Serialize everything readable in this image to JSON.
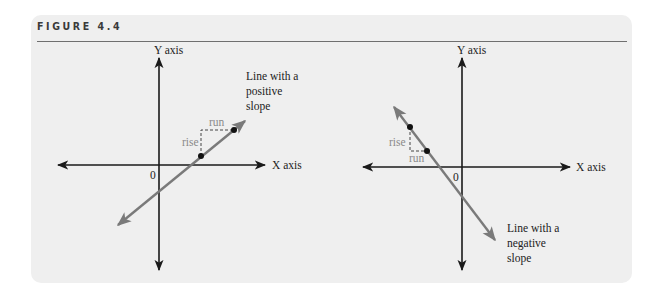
{
  "figure": {
    "title": "FIGURE 4.4"
  },
  "left_panel": {
    "y_axis_label": "Y axis",
    "x_axis_label": "X axis",
    "origin_label": "0",
    "line_label_lines": [
      "Line with a",
      "positive",
      "slope"
    ],
    "rise_label": "rise",
    "run_label": "run",
    "slope": "positive"
  },
  "right_panel": {
    "y_axis_label": "Y axis",
    "x_axis_label": "X axis",
    "origin_label": "0",
    "line_label_lines": [
      "Line with a",
      "negative",
      "slope"
    ],
    "rise_label": "rise",
    "run_label": "run",
    "slope": "negative"
  },
  "colors": {
    "panel_bg": "#efefef",
    "axis": "#1a1a1a",
    "slope_line": "#7a7a7a",
    "rise_run_text": "#8a8a8a",
    "point": "#111111"
  }
}
